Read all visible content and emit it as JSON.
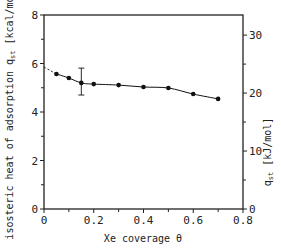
{
  "chart_data": {
    "type": "line",
    "title": "",
    "xlabel": "Xe coverage θ",
    "ylabel": "isosteric heat of adsorption q_st [kcal/mol]",
    "ylabel_right": "q_st [kJ/mol]",
    "xlim": [
      0,
      0.8
    ],
    "ylim": [
      0,
      8
    ],
    "ylim_right": [
      0,
      33.47
    ],
    "x_ticks": [
      0,
      0.2,
      0.4,
      0.6,
      0.8
    ],
    "x_tick_labels": [
      "0",
      "0.2",
      "0.4",
      "0.6",
      "0.8"
    ],
    "x_minor_ticks": [
      0.1,
      0.3,
      0.5,
      0.7
    ],
    "y_ticks": [
      0,
      2,
      4,
      6,
      8
    ],
    "y_tick_labels": [
      "0",
      "2",
      "4",
      "6",
      "8"
    ],
    "y_minor_ticks": [
      1,
      3,
      5,
      7
    ],
    "y_right_ticks": [
      0,
      10,
      20,
      30
    ],
    "y_right_tick_labels": [
      "0",
      "10",
      "20",
      "30"
    ],
    "y_right_minor_ticks": [
      5,
      15,
      25
    ],
    "grid": false,
    "legend": null,
    "series": [
      {
        "name": "q_st",
        "x": [
          0.05,
          0.1,
          0.15,
          0.2,
          0.3,
          0.4,
          0.5,
          0.6,
          0.7
        ],
        "y": [
          5.57,
          5.4,
          5.2,
          5.15,
          5.11,
          5.03,
          4.99,
          4.74,
          4.54
        ],
        "marker": "circle",
        "line": "solid"
      }
    ],
    "error_bars": [
      {
        "x": 0.15,
        "y": 5.2,
        "low": 4.7,
        "high": 5.81
      }
    ],
    "extrapolation": {
      "style": "dashed",
      "x": [
        0.0,
        0.05
      ],
      "y": [
        5.85,
        5.57
      ]
    }
  },
  "labels": {
    "xlabel": "Xe coverage θ",
    "ylabel_left": "isosteric heat of adsorption q",
    "ylabel_left_sub": "st",
    "ylabel_left_unit": " [kcal/mol]",
    "ylabel_right": "q",
    "ylabel_right_sub": "st",
    "ylabel_right_unit": " [kJ/mol]"
  },
  "colors": {
    "axis": "#222222",
    "line": "#111111",
    "marker": "#111111",
    "background": "#ffffff"
  }
}
